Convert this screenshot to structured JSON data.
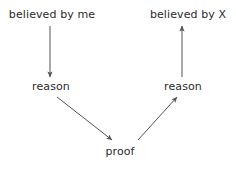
{
  "diagram": {
    "background_color": "#ffffff",
    "text_color": "#2b2b2b",
    "edge_color": "#555555",
    "nodes": {
      "believed_by_me": "believed by me",
      "believed_by_x": "believed by X",
      "reason_left": "reason",
      "reason_right": "reason",
      "proof": "proof"
    },
    "edges": [
      {
        "name": "believed-by-me-to-reason-left",
        "from": "believed_by_me",
        "to": "reason_left",
        "direction": "down",
        "x1": 50,
        "y1": 26,
        "x2": 50,
        "y2": 77
      },
      {
        "name": "reason-left-to-proof",
        "from": "reason_left",
        "to": "proof",
        "direction": "down-right",
        "x1": 57,
        "y1": 97,
        "x2": 112,
        "y2": 140
      },
      {
        "name": "proof-to-reason-right",
        "from": "proof",
        "to": "reason_right",
        "direction": "up-right",
        "x1": 138,
        "y1": 140,
        "x2": 177,
        "y2": 97
      },
      {
        "name": "reason-right-to-believed-by-x",
        "from": "reason_right",
        "to": "believed_by_x",
        "direction": "up",
        "x1": 182,
        "y1": 77,
        "x2": 182,
        "y2": 26
      }
    ]
  }
}
